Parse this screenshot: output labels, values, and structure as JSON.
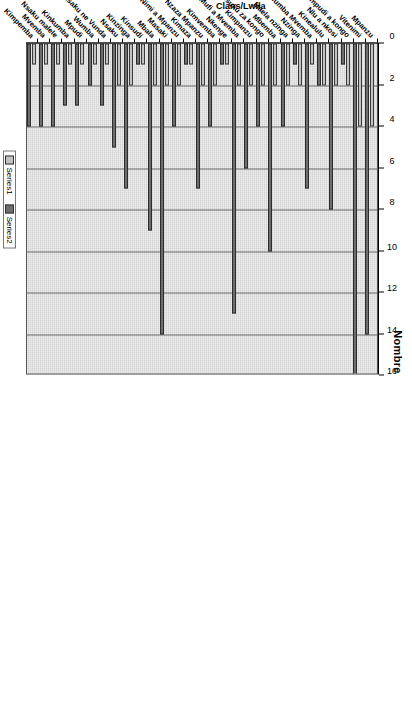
{
  "chart_data": {
    "type": "bar",
    "orientation": "horizontal",
    "title": "Nombre",
    "xlabel": "Nombre",
    "ylabel": "Clans/Lwila",
    "xlim": [
      0,
      16
    ],
    "xticks": [
      0,
      2,
      4,
      6,
      8,
      10,
      12,
      14,
      16
    ],
    "grid": true,
    "legend_position": "bottom",
    "categories": [
      "Mpanzu",
      "Vitenimi",
      "Nimpudi a kongo",
      "Nlu a nkosi",
      "Kinealulu",
      "Nimlumba Mvemba",
      "Nzinga",
      "Maela nzinga",
      "Mbemba",
      "Nsuku za kongo",
      "Kimpanzu",
      "Mufi a Mvemba",
      "Nkenge",
      "Kimvemba",
      "Nzaza Mpanzu",
      "Kimaza",
      "Nimi a Mpanzu",
      "Masaki",
      "Mbala",
      "Kinsudi",
      "Kinzinga",
      "Nsaku",
      "Nsaku ne Vunda",
      "Wumba",
      "Mpudi",
      "Kinkumba",
      "Nsaku malele",
      "Mvemba",
      "Kimpemba"
    ],
    "series": [
      {
        "name": "Series1",
        "color": "#c2c2c2",
        "values": [
          4,
          4,
          2,
          2,
          2,
          1,
          2,
          2,
          2,
          2,
          2,
          2,
          1,
          2,
          2,
          1,
          2,
          2,
          2,
          1,
          2,
          2,
          1,
          1,
          1,
          1,
          1,
          1,
          1
        ]
      },
      {
        "name": "Series2",
        "color": "#6e6e6e",
        "values": [
          14,
          16,
          1,
          8,
          2,
          7,
          1,
          4,
          10,
          4,
          6,
          13,
          1,
          4,
          7,
          1,
          4,
          14,
          9,
          1,
          7,
          5,
          3,
          2,
          3,
          3,
          4,
          4,
          4
        ]
      }
    ]
  },
  "legend": {
    "items": [
      {
        "label": "Series1"
      },
      {
        "label": "Series2"
      }
    ]
  }
}
